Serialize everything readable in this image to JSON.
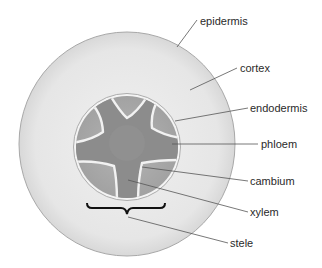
{
  "diagram": {
    "type": "root-cross-section",
    "colors": {
      "background": "#ffffff",
      "cortex": "#e9e9e9",
      "cortex_edge": "#a8a8a8",
      "endodermis": "#f4f4f4",
      "phloem": "#a9a9a9",
      "xylem": "#8c8c8c",
      "cambium": "#f2f2f2",
      "bracket": "#111111",
      "leader": "#555555",
      "text": "#2a2a2a"
    },
    "labels": [
      {
        "id": "epidermis",
        "text": "epidermis"
      },
      {
        "id": "cortex",
        "text": "cortex"
      },
      {
        "id": "endodermis",
        "text": "endodermis"
      },
      {
        "id": "phloem",
        "text": "phloem"
      },
      {
        "id": "cambium",
        "text": "cambium"
      },
      {
        "id": "xylem",
        "text": "xylem"
      },
      {
        "id": "stele",
        "text": "stele"
      }
    ]
  }
}
